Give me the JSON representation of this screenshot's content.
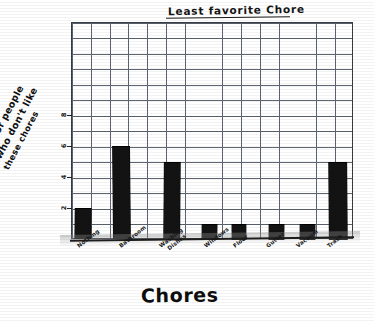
{
  "chart_data": {
    "type": "bar",
    "title": "Least favorite Chore",
    "xlabel": "Chores",
    "ylabel": "# of people who don't like these chores",
    "ylabel_lines": [
      "# of people",
      "who don't like",
      "these chores"
    ],
    "categories": [
      "Nothing",
      "Bathroom",
      "Washing Dishes",
      "Windows",
      "Floor",
      "Gutter",
      "Vacuum",
      "Trash"
    ],
    "category_lines": [
      [
        "Nothing"
      ],
      [
        "Bathroom"
      ],
      [
        "Washing",
        "Dishes"
      ],
      [
        "Windows"
      ],
      [
        "Floor"
      ],
      [
        "Gutter"
      ],
      [
        "Vacuum"
      ],
      [
        "Trash"
      ]
    ],
    "values": [
      2,
      6,
      5,
      1,
      1,
      1,
      1,
      5
    ],
    "ylim": [
      0,
      14
    ],
    "ytick_labels": [
      "2",
      "4",
      "6",
      "8"
    ],
    "ytick_values": [
      2,
      4,
      6,
      8
    ],
    "grid": true,
    "grid_rows": 14,
    "grid_cols": 15,
    "legend": "none",
    "style": "hand-drawn on graph paper",
    "bar_color": "#131313",
    "grid_color": "#5d6570",
    "ink_color": "#141414"
  }
}
